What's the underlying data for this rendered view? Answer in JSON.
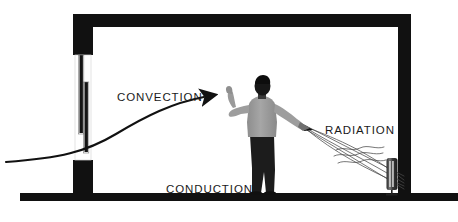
{
  "diagram": {
    "background_color": "#ffffff",
    "structure_color": "#111111",
    "labels": {
      "convection": "CONVECTION",
      "conduction": "CONDUCTION",
      "radiation": "RADIATION"
    },
    "objects": {
      "person": "person-standing",
      "window": "window-left-wall",
      "heater": "electric-heater",
      "floor": "floor-slab",
      "ceiling": "ceiling-slab",
      "left_wall": "left-wall",
      "right_wall": "right-wall",
      "convection_arrow": "convection-curved-arrow",
      "radiation_rays": "radiation-rays"
    },
    "colors": {
      "structure": "#111111",
      "text": "#1a1a1a",
      "person_shirt": "#9a9a9a",
      "person_trousers": "#1c1c1c",
      "line": "#3a3a3a"
    }
  }
}
